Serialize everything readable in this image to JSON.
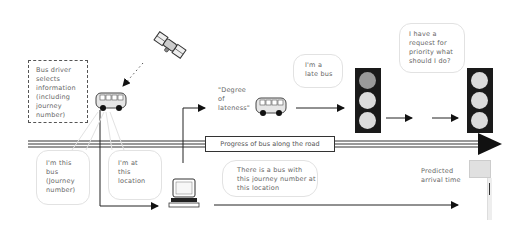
{
  "diagram": {
    "driver_box": {
      "text": "Bus driver selects information (including journey number)"
    },
    "bubble_bus_id": {
      "text": "I'm this bus (Journey number)"
    },
    "bubble_location": {
      "text": "I'm at this location"
    },
    "server_bubble": {
      "text": "There is a bus with this journey number at this location"
    },
    "degree_lateness": {
      "text": "\"Degree of lateness\""
    },
    "late_bus_bubble": {
      "text": "I'm a late bus"
    },
    "priority_bubble": {
      "text": "I have a request for priority what should I do?"
    },
    "road_label": {
      "text": "Progress of bus along the road"
    },
    "predicted_arrival": {
      "text": "Predicted arrival time"
    },
    "icons": [
      "satellite-icon",
      "bus-icon",
      "computer-terminal-icon",
      "traffic-light-icon",
      "bus-stop-sign-icon"
    ],
    "colors": {
      "line": "#222222",
      "bubble_border": "#e2e2e2",
      "traffic_light_body": "#1a1a1a",
      "lamp_active": "#9a9a9a",
      "lamp_inactive": "#dcdcdc"
    }
  }
}
